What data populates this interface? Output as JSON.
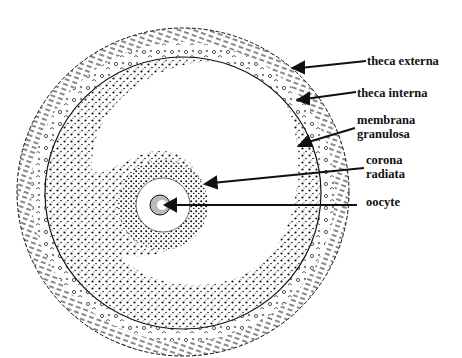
{
  "figure": {
    "colors": {
      "ink": "#111111",
      "background": "#ffffff"
    }
  },
  "labels": [
    {
      "id": "theca-externa",
      "text": "theca externa",
      "lines": [
        "theca externa"
      ],
      "x": 367,
      "y": 54,
      "arrow_from": [
        366,
        61
      ],
      "arrow_to": [
        295,
        68
      ]
    },
    {
      "id": "theca-interna",
      "text": "theca interna",
      "lines": [
        "theca interna"
      ],
      "x": 357,
      "y": 88,
      "arrow_from": [
        356,
        92
      ],
      "arrow_to": [
        300,
        100
      ]
    },
    {
      "id": "membrana-granulosa",
      "text": "membrana granulosa",
      "lines": [
        "membrana",
        "granulosa"
      ],
      "x": 357,
      "y": 115,
      "arrow_from": [
        355,
        128
      ],
      "arrow_to": [
        300,
        145
      ]
    },
    {
      "id": "corona-radiata",
      "text": "corona radiata",
      "lines": [
        "corona",
        "radiata"
      ],
      "x": 366,
      "y": 155,
      "arrow_from": [
        364,
        168
      ],
      "arrow_to": [
        205,
        183
      ]
    },
    {
      "id": "oocyte",
      "text": "oocyte",
      "lines": [
        "oocyte"
      ],
      "x": 366,
      "y": 197,
      "arrow_from": [
        357,
        205
      ],
      "arrow_to": [
        165,
        205
      ]
    }
  ]
}
